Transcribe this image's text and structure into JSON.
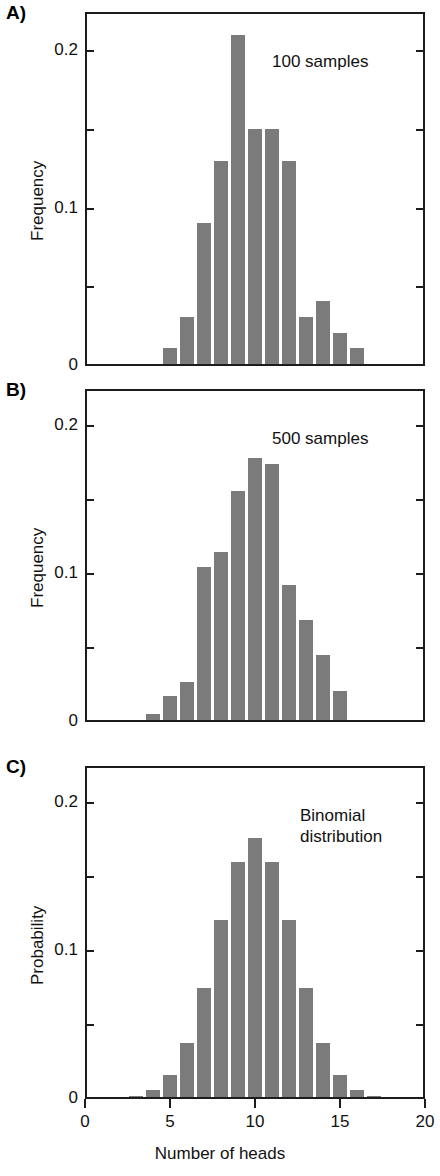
{
  "figure": {
    "xaxis_title": "Number of heads",
    "x_ticks": [
      "0",
      "5",
      "10",
      "15",
      "20"
    ],
    "x_tick_values": [
      0,
      5,
      10,
      15,
      20
    ],
    "xlim": [
      0,
      20
    ]
  },
  "panels": [
    {
      "letter": "A)",
      "ylabel": "Frequency",
      "y_ticks": [
        "0",
        "0.1",
        "0.2"
      ],
      "annotation": "100 samples"
    },
    {
      "letter": "B)",
      "ylabel": "Frequency",
      "y_ticks": [
        "0",
        "0.1",
        "0.2"
      ],
      "annotation": "500 samples"
    },
    {
      "letter": "C)",
      "ylabel": "Probability",
      "y_ticks": [
        "0",
        "0.1",
        "0.2"
      ],
      "annotation": "Binomial\ndistribution"
    }
  ],
  "chart_data": [
    {
      "type": "bar",
      "panel": "A)",
      "title": "100 samples",
      "xlabel": "Number of heads",
      "ylabel": "Frequency",
      "xlim": [
        0,
        20
      ],
      "ylim": [
        0,
        0.225
      ],
      "ytick_values": [
        0,
        0.05,
        0.1,
        0.15,
        0.2
      ],
      "ytick_labels": [
        "0",
        "",
        "0.1",
        "",
        "0.2"
      ],
      "grid": false,
      "legend": "none",
      "bar_color": "#7b7b7b",
      "categories": [
        0,
        1,
        2,
        3,
        4,
        5,
        6,
        7,
        8,
        9,
        10,
        11,
        12,
        13,
        14,
        15,
        16,
        17,
        18,
        19,
        20
      ],
      "values": [
        0,
        0,
        0,
        0,
        0,
        0.01,
        0.03,
        0.09,
        0.13,
        0.21,
        0.15,
        0.15,
        0.13,
        0.03,
        0.04,
        0.02,
        0.01,
        0,
        0,
        0,
        0
      ]
    },
    {
      "type": "bar",
      "panel": "B)",
      "title": "500 samples",
      "xlabel": "Number of heads",
      "ylabel": "Frequency",
      "xlim": [
        0,
        20
      ],
      "ylim": [
        0,
        0.225
      ],
      "ytick_values": [
        0,
        0.05,
        0.1,
        0.15,
        0.2
      ],
      "ytick_labels": [
        "0",
        "",
        "0.1",
        "",
        "0.2"
      ],
      "grid": false,
      "legend": "none",
      "bar_color": "#7b7b7b",
      "categories": [
        0,
        1,
        2,
        3,
        4,
        5,
        6,
        7,
        8,
        9,
        10,
        11,
        12,
        13,
        14,
        15,
        16,
        17,
        18,
        19,
        20
      ],
      "values": [
        0,
        0,
        0,
        0,
        0.004,
        0.016,
        0.026,
        0.104,
        0.114,
        0.156,
        0.178,
        0.174,
        0.092,
        0.068,
        0.044,
        0.02,
        0,
        0,
        0,
        0,
        0
      ]
    },
    {
      "type": "bar",
      "panel": "C)",
      "title": "Binomial distribution",
      "xlabel": "Number of heads",
      "ylabel": "Probability",
      "xlim": [
        0,
        20
      ],
      "ylim": [
        0,
        0.225
      ],
      "ytick_values": [
        0,
        0.05,
        0.1,
        0.15,
        0.2
      ],
      "ytick_labels": [
        "0",
        "",
        "0.1",
        "",
        "0.2"
      ],
      "grid": false,
      "legend": "none",
      "bar_color": "#7b7b7b",
      "categories": [
        0,
        1,
        2,
        3,
        4,
        5,
        6,
        7,
        8,
        9,
        10,
        11,
        12,
        13,
        14,
        15,
        16,
        17,
        18,
        19,
        20
      ],
      "values": [
        0,
        0,
        0,
        0.001,
        0.005,
        0.015,
        0.037,
        0.074,
        0.12,
        0.16,
        0.176,
        0.16,
        0.12,
        0.074,
        0.037,
        0.015,
        0.005,
        0.001,
        0,
        0,
        0
      ]
    }
  ]
}
